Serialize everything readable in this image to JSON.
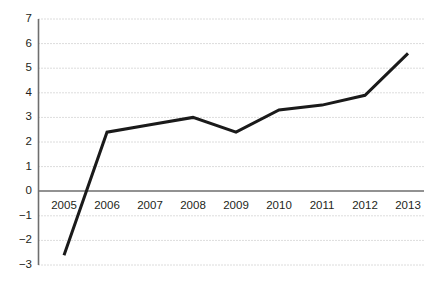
{
  "chart_data": {
    "type": "line",
    "title": "",
    "subtitle": "",
    "xlabel": "",
    "ylabel": "",
    "categories": [
      "2005",
      "2006",
      "2007",
      "2008",
      "2009",
      "2010",
      "2011",
      "2012",
      "2013"
    ],
    "values": [
      -2.6,
      2.4,
      2.7,
      3.0,
      2.4,
      3.3,
      3.5,
      3.9,
      5.6
    ],
    "series": [
      {
        "name": "",
        "values": [
          -2.6,
          2.4,
          2.7,
          3.0,
          2.4,
          3.3,
          3.5,
          3.9,
          5.6
        ]
      }
    ],
    "ylim": [
      -3,
      7
    ],
    "y_ticks": [
      "7",
      "6",
      "5",
      "4",
      "3",
      "2",
      "1",
      "0",
      "−1",
      "−2",
      "−3"
    ],
    "y_tick_values": [
      7,
      6,
      5,
      4,
      3,
      2,
      1,
      0,
      -1,
      -2,
      -3
    ],
    "x_ticks": [
      "2005",
      "2006",
      "2007",
      "2008",
      "2009",
      "2010",
      "2011",
      "2012",
      "2013"
    ],
    "grid": true,
    "grid_style": "dotted",
    "legend": "none",
    "annotations": [],
    "colors": {
      "line": "#1a1a1a",
      "grid": "#b9b9b9",
      "axis": "#6e6e6e",
      "text": "#231f20",
      "background": "#ffffff"
    },
    "line_width": 3
  }
}
